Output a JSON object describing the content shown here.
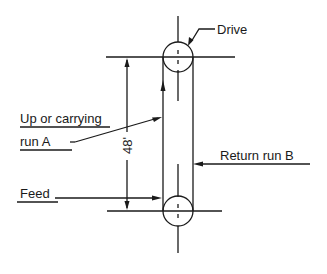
{
  "diagram": {
    "type": "belt-conveyor-elevation",
    "labels": {
      "drive": "Drive",
      "carrying_run_line1": "Up or carrying",
      "carrying_run_line2": "run A",
      "return_run": "Return run B",
      "feed": "Feed",
      "dimension": "48'"
    },
    "colors": {
      "ink": "#1a1a1a",
      "background": "#ffffff"
    },
    "geometry": {
      "top_pulley": {
        "cx": 178,
        "cy": 57,
        "r": 15
      },
      "bottom_pulley": {
        "cx": 178,
        "cy": 211,
        "r": 15
      },
      "belt_left_x": 163,
      "belt_right_x": 193,
      "dimension_line_x": 127
    }
  }
}
